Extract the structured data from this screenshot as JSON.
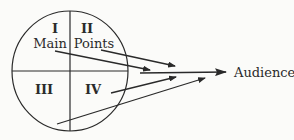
{
  "diagram": {
    "quadrants": [
      {
        "numeral": "I",
        "word": "Main"
      },
      {
        "numeral": "II",
        "word": "Points"
      },
      {
        "numeral": "III",
        "word": ""
      },
      {
        "numeral": "IV",
        "word": ""
      }
    ],
    "target_label": "Audience",
    "colors": {
      "ink": "#2a2a2a",
      "background": "#fbfbf9"
    }
  }
}
